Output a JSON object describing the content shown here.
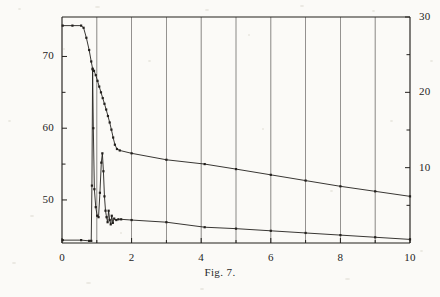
{
  "caption": "Fig. 7.",
  "chart_data": {
    "type": "line",
    "title": "",
    "subtitle": "",
    "xlabel": "",
    "ylabel": "",
    "y2label": "",
    "xlim": [
      0,
      10
    ],
    "ylim": [
      44,
      75.5
    ],
    "y2lim": [
      0,
      30
    ],
    "grid": true,
    "grid_axis": "x",
    "legend": "none",
    "annotations": [
      "Fig. 7."
    ],
    "axes": {
      "x": {
        "min": 0,
        "max": 10,
        "tick_step": 1,
        "labeled_ticks": [
          0,
          2,
          4,
          6,
          8,
          10
        ],
        "tick_labels": [
          "0",
          "2",
          "4",
          "6",
          "8",
          "10"
        ]
      },
      "y_left": {
        "min": 44,
        "max": 75.5,
        "tick_step": 5,
        "ticks": [
          50,
          55,
          60,
          65,
          70
        ],
        "labeled_ticks": [
          50,
          60,
          70
        ],
        "tick_labels": [
          "50",
          "60",
          "70"
        ]
      },
      "y_right": {
        "min": 0,
        "max": 30,
        "tick_step": 5,
        "ticks": [
          5,
          10,
          15,
          20,
          25,
          30
        ],
        "labeled_ticks": [
          10,
          20,
          30
        ],
        "tick_labels": [
          "10",
          "20",
          "30"
        ]
      }
    },
    "series": [
      {
        "name": "upper-curve",
        "axis": "y_left",
        "markers": true,
        "points": [
          [
            0.02,
            74.3
          ],
          [
            0.3,
            74.3
          ],
          [
            0.55,
            74.3
          ],
          [
            0.62,
            74.0
          ],
          [
            0.7,
            72.6
          ],
          [
            0.78,
            70.9
          ],
          [
            0.84,
            69.3
          ],
          [
            0.88,
            68.3
          ],
          [
            0.92,
            68.0
          ],
          [
            0.97,
            67.4
          ],
          [
            1.02,
            66.6
          ],
          [
            1.07,
            65.8
          ],
          [
            1.12,
            65.0
          ],
          [
            1.17,
            64.2
          ],
          [
            1.22,
            63.4
          ],
          [
            1.27,
            62.6
          ],
          [
            1.32,
            61.7
          ],
          [
            1.37,
            60.8
          ],
          [
            1.42,
            59.8
          ],
          [
            1.47,
            58.7
          ],
          [
            1.52,
            57.7
          ],
          [
            1.58,
            57.1
          ],
          [
            1.66,
            56.9
          ],
          [
            2.0,
            56.5
          ],
          [
            3.0,
            55.6
          ],
          [
            4.1,
            55.0
          ],
          [
            5.0,
            54.3
          ],
          [
            6.0,
            53.5
          ],
          [
            7.0,
            52.7
          ],
          [
            8.0,
            51.9
          ],
          [
            9.0,
            51.2
          ],
          [
            10.0,
            50.5
          ]
        ]
      },
      {
        "name": "lower-curve",
        "axis": "y_left",
        "markers": true,
        "points": [
          [
            0.02,
            44.4
          ],
          [
            0.55,
            44.4
          ],
          [
            0.78,
            44.3
          ],
          [
            0.84,
            44.3
          ],
          [
            0.86,
            52.0
          ],
          [
            0.88,
            68.2
          ],
          [
            0.9,
            60.0
          ],
          [
            0.93,
            51.5
          ],
          [
            0.97,
            49.0
          ],
          [
            1.01,
            47.8
          ],
          [
            1.05,
            47.6
          ],
          [
            1.09,
            51.0
          ],
          [
            1.13,
            55.2
          ],
          [
            1.16,
            56.5
          ],
          [
            1.19,
            54.0
          ],
          [
            1.22,
            50.5
          ],
          [
            1.25,
            48.5
          ],
          [
            1.28,
            47.6
          ],
          [
            1.31,
            46.9
          ],
          [
            1.34,
            48.5
          ],
          [
            1.37,
            47.2
          ],
          [
            1.4,
            46.6
          ],
          [
            1.43,
            47.8
          ],
          [
            1.46,
            46.8
          ],
          [
            1.5,
            47.4
          ],
          [
            1.56,
            47.2
          ],
          [
            1.62,
            47.3
          ],
          [
            1.7,
            47.3
          ],
          [
            2.0,
            47.2
          ],
          [
            3.0,
            46.9
          ],
          [
            4.1,
            46.2
          ],
          [
            5.0,
            46.0
          ],
          [
            6.0,
            45.7
          ],
          [
            7.0,
            45.4
          ],
          [
            8.0,
            45.1
          ],
          [
            9.0,
            44.8
          ],
          [
            10.0,
            44.5
          ]
        ]
      }
    ]
  }
}
